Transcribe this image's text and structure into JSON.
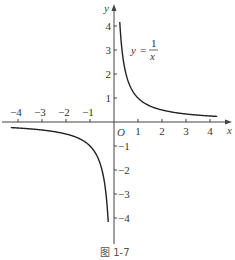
{
  "chart_data": {
    "type": "line",
    "title": "",
    "caption": "图 1-7",
    "xlabel": "x",
    "ylabel": "y",
    "origin_label": "O",
    "xlim": [
      -4.5,
      4.7
    ],
    "ylim": [
      -4.5,
      4.7
    ],
    "grid": false,
    "legend": null,
    "x_ticks": [
      -4,
      -3,
      -2,
      -1,
      1,
      2,
      3,
      4
    ],
    "x_tick_labels": [
      "−4",
      "−3",
      "−2",
      "−1",
      "1",
      "2",
      "3",
      "4"
    ],
    "y_ticks": [
      -4,
      -3,
      -2,
      -1,
      1,
      2,
      3,
      4
    ],
    "y_tick_labels": [
      "−4",
      "−3",
      "−2",
      "−1",
      "1",
      "2",
      "3",
      "4"
    ],
    "annotation": {
      "text": "y = 1/x",
      "lhs": "y",
      "numerator": "1",
      "denominator": "x",
      "position": [
        1.2,
        3.0
      ]
    },
    "series": [
      {
        "name": "y = 1/x (x > 0)",
        "x": [
          0.24,
          0.3,
          0.4,
          0.5,
          0.75,
          1,
          1.5,
          2,
          3,
          4,
          4.3
        ],
        "y": [
          4.17,
          3.33,
          2.5,
          2.0,
          1.33,
          1.0,
          0.67,
          0.5,
          0.33,
          0.25,
          0.23
        ]
      },
      {
        "name": "y = 1/x (x < 0)",
        "x": [
          -4.3,
          -4,
          -3,
          -2,
          -1.5,
          -1,
          -0.75,
          -0.5,
          -0.4,
          -0.3,
          -0.24
        ],
        "y": [
          -0.23,
          -0.25,
          -0.33,
          -0.5,
          -0.67,
          -1.0,
          -1.33,
          -2.0,
          -2.5,
          -3.33,
          -4.17
        ]
      }
    ]
  }
}
